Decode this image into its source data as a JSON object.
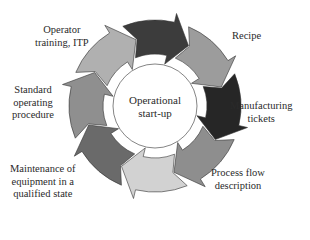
{
  "diagram": {
    "center": {
      "line1": "Operational",
      "line2": "start-up"
    },
    "segments": [
      {
        "id": "top",
        "color": "#3c3c3c"
      },
      {
        "id": "recipe",
        "color": "#9c9c9c"
      },
      {
        "id": "manufacturing-tickets",
        "color": "#262626"
      },
      {
        "id": "process-flow",
        "color": "#8e8e8e"
      },
      {
        "id": "bottom",
        "color": "#d2d2d2"
      },
      {
        "id": "maintenance",
        "color": "#6a6a6a"
      },
      {
        "id": "sop",
        "color": "#8f8f8f"
      },
      {
        "id": "operator-training",
        "color": "#b0b0b0"
      }
    ],
    "labels": {
      "recipe": {
        "line1": "Recipe"
      },
      "manufacturing": {
        "line1": "Manufacturing",
        "line2": "tickets"
      },
      "process_flow": {
        "line1": "Process flow",
        "line2": "description"
      },
      "maintenance": {
        "line1": "Maintenance of",
        "line2": "equipment in a",
        "line3": "qualified state"
      },
      "sop": {
        "line1": "Standard",
        "line2": "operating",
        "line3": "procedure"
      },
      "operator": {
        "line1": "Operator",
        "line2": "training, ITP"
      }
    }
  }
}
